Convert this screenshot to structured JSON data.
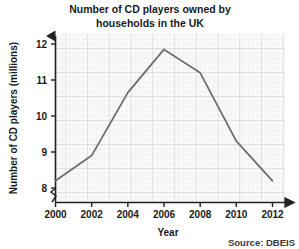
{
  "chart_data": {
    "type": "line",
    "title": "Number of CD players owned by households in the UK",
    "title_line1": "Number of CD players owned by",
    "title_line2": "households in the UK",
    "xlabel": "Year",
    "ylabel": "Number of CD players (millions)",
    "x": [
      2000,
      2002,
      2004,
      2006,
      2008,
      2010,
      2012
    ],
    "values": [
      8.2,
      8.9,
      10.65,
      11.85,
      11.2,
      9.3,
      8.2
    ],
    "series": [
      {
        "name": "CD players owned",
        "values": [
          8.2,
          8.9,
          10.65,
          11.85,
          11.2,
          9.3,
          8.2
        ],
        "color": "#6e6e6e"
      }
    ],
    "xticks": [
      "2000",
      "2002",
      "2004",
      "2006",
      "2008",
      "2010",
      "2012"
    ],
    "yticks": [
      "8",
      "9",
      "10",
      "11",
      "12"
    ],
    "ytick_values": [
      8,
      9,
      10,
      11,
      12
    ],
    "xlim": [
      2000,
      2012
    ],
    "ylim": [
      7.6,
      12.35
    ],
    "grid": true,
    "grid_minor": true,
    "axis_break_y": true,
    "legend": "none",
    "source": "Source: DBEIS",
    "colors": {
      "line": "#6e6e6e",
      "axis": "#222222",
      "grid_minor": "#e2e2e6",
      "grid_major": "#c9c9cf",
      "plot_background": "#fafafa"
    }
  }
}
